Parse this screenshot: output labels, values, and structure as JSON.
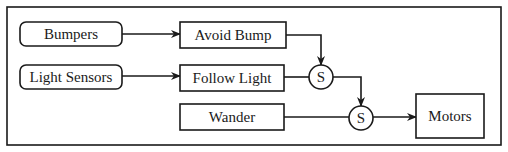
{
  "diagram": {
    "type": "subsumption-architecture",
    "sensors": [
      {
        "id": "bumpers",
        "label": "Bumpers"
      },
      {
        "id": "light-sensors",
        "label": "Light Sensors"
      }
    ],
    "behaviors": [
      {
        "id": "avoid-bump",
        "label": "Avoid Bump"
      },
      {
        "id": "follow-light",
        "label": "Follow Light"
      },
      {
        "id": "wander",
        "label": "Wander"
      }
    ],
    "suppressors": [
      {
        "id": "s1",
        "label": "S"
      },
      {
        "id": "s2",
        "label": "S"
      }
    ],
    "actuators": [
      {
        "id": "motors",
        "label": "Motors"
      }
    ],
    "edges": [
      {
        "from": "bumpers",
        "to": "avoid-bump"
      },
      {
        "from": "light-sensors",
        "to": "follow-light"
      },
      {
        "from": "avoid-bump",
        "to": "s1"
      },
      {
        "from": "follow-light",
        "to": "s1"
      },
      {
        "from": "s1",
        "to": "s2"
      },
      {
        "from": "wander",
        "to": "s2"
      },
      {
        "from": "s2",
        "to": "motors"
      }
    ]
  }
}
